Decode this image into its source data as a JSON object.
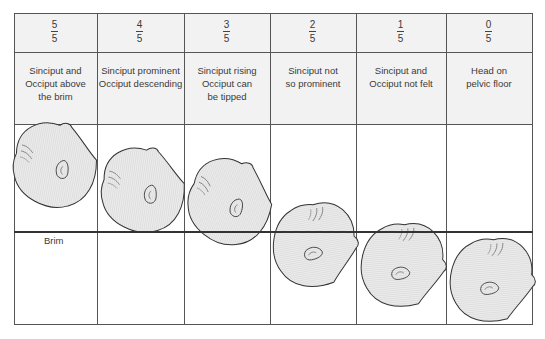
{
  "diagram": {
    "title": "",
    "columns": [
      {
        "numerator": "5",
        "denominator": "5",
        "description": [
          "Sinciput and",
          "Occiput above",
          "the brim"
        ]
      },
      {
        "numerator": "4",
        "denominator": "5",
        "description": [
          "Sinciput prominent",
          "Occiput descending"
        ]
      },
      {
        "numerator": "3",
        "denominator": "5",
        "description": [
          "Sinciput rising",
          "Occiput can",
          "be tipped"
        ]
      },
      {
        "numerator": "2",
        "denominator": "5",
        "description": [
          "Sinciput not",
          "so prominent"
        ]
      },
      {
        "numerator": "1",
        "denominator": "5",
        "description": [
          "Sinciput and",
          "Occiput not felt"
        ]
      },
      {
        "numerator": "0",
        "denominator": "5",
        "description": [
          "Head on",
          "pelvic floor"
        ]
      }
    ],
    "brim_label": "Brim",
    "colors": {
      "grid": "#555555",
      "header_bg": "#f2f2f2",
      "head_fill": "#e6e6e6",
      "head_outline": "#333333"
    }
  }
}
